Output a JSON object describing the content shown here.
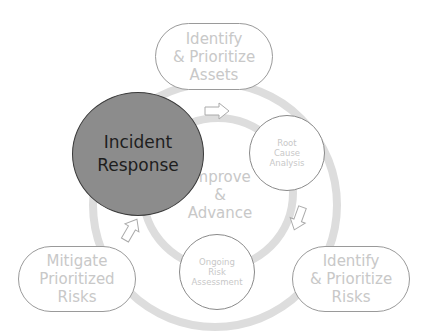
{
  "diagram": {
    "center_label": [
      "Improve",
      "&",
      "Advance"
    ],
    "highlight": {
      "label": [
        "Incident",
        "Response"
      ],
      "fill": "#8c8c8c",
      "text_color": "#1e1e1e"
    },
    "outer_nodes": [
      {
        "id": "assets",
        "label": [
          "Identify",
          "& Prioritize",
          "Assets"
        ]
      },
      {
        "id": "risks",
        "label": [
          "Identify",
          "& Prioritize",
          "Risks"
        ]
      },
      {
        "id": "mitigate",
        "label": [
          "Mitigate",
          "Prioritized",
          "Risks"
        ]
      }
    ],
    "inner_nodes": [
      {
        "id": "root-cause",
        "label": [
          "Root",
          "Cause",
          "Analysis"
        ]
      },
      {
        "id": "ongoing",
        "label": [
          "Ongoing",
          "Risk",
          "Assessment"
        ]
      }
    ],
    "colors": {
      "ring": "#dcdcdc",
      "node_text": "#c8c8c8",
      "border": "#999999"
    }
  }
}
